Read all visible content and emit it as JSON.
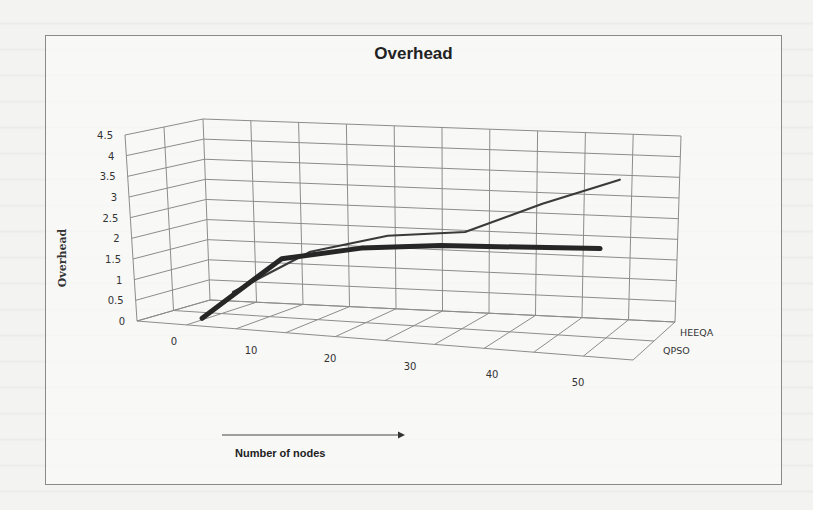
{
  "chart_data": {
    "type": "line",
    "title": "Overhead",
    "xlabel": "Number of nodes",
    "ylabel": "Overhead",
    "x": [
      0,
      10,
      20,
      30,
      40,
      50
    ],
    "categories": [
      "0",
      "10",
      "20",
      "30",
      "40",
      "50"
    ],
    "y_ticks": [
      "0",
      "0.5",
      "1",
      "1.5",
      "2",
      "2.5",
      "3",
      "3.5",
      "4",
      "4.5"
    ],
    "ylim": [
      0,
      4.5
    ],
    "grid": true,
    "projection": "3d",
    "legend_position": "depth-axis-right",
    "series": [
      {
        "name": "QPSO",
        "values": [
          0.0,
          1.6,
          2.0,
          2.2,
          2.3,
          2.4
        ],
        "style": "thick-dark"
      },
      {
        "name": "HEEQA",
        "values": [
          0.4,
          1.5,
          2.0,
          2.2,
          3.0,
          3.7
        ],
        "style": "thin-dark"
      }
    ],
    "depth_labels": [
      "HEEQA",
      "QPSO"
    ]
  },
  "colors": {
    "grid": "#8c8c8c",
    "line_thick": "#2a2a2a",
    "line_thin": "#3a3a3a",
    "background": "#f3f3f1"
  }
}
